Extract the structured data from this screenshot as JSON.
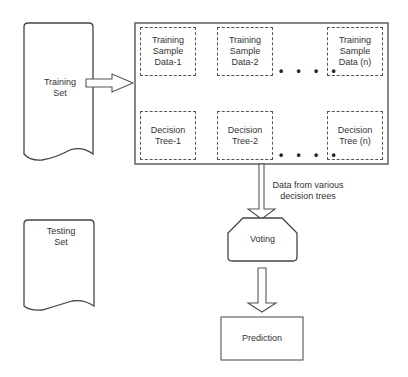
{
  "diagram": {
    "training_set": {
      "label": "Training\nSet"
    },
    "testing_set": {
      "label": "Testing\nSet"
    },
    "samples": [
      {
        "label": "Training\nSample\nData-1"
      },
      {
        "label": "Training\nSample\nData-2"
      },
      {
        "label": "Training\nSample\nData (n)"
      }
    ],
    "trees": [
      {
        "label": "Decision\nTree-1"
      },
      {
        "label": "Decision\nTree-2"
      },
      {
        "label": "Decision\nTree (n)"
      }
    ],
    "ellipsis": "• • • •",
    "edge_label": "Data from various\ndecision trees",
    "voting": {
      "label": "Voting"
    },
    "prediction": {
      "label": "Prediction"
    },
    "colors": {
      "stroke": "#555555",
      "text": "#333333",
      "background": "#ffffff"
    }
  }
}
